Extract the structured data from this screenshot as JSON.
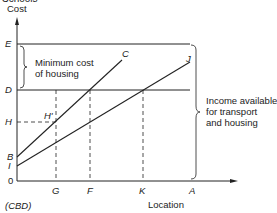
{
  "header_partial": "Schools",
  "axes": {
    "y_label": "Cost",
    "x_label": "Location",
    "origin": "0",
    "origin_note": "(CBD)"
  },
  "y_points": {
    "E": "E",
    "D": "D",
    "H": "H",
    "B": "B",
    "I": "I"
  },
  "x_points": {
    "G": "G",
    "F": "F",
    "K": "K",
    "A": "A"
  },
  "curve_labels": {
    "C": "C",
    "J": "J",
    "H_prime": "H'"
  },
  "annotations": {
    "min_cost_1": "Minimum cost",
    "min_cost_2": "of housing",
    "income_1": "Income available",
    "income_2": "for transport",
    "income_3": "and housing"
  }
}
